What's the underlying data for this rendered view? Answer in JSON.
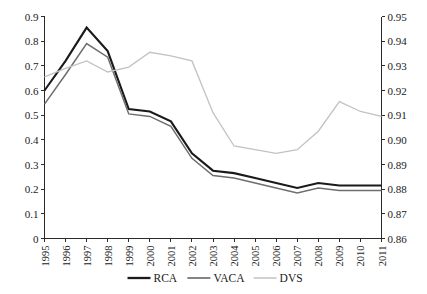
{
  "chart_data": {
    "type": "line",
    "title": "",
    "subtitle": "",
    "xlabel": "",
    "ylabel": "",
    "grid": false,
    "legend_position": "bottom",
    "categories": [
      "1995",
      "1996",
      "1997",
      "1998",
      "1999",
      "2000",
      "2001",
      "2002",
      "2003",
      "2004",
      "2005",
      "2006",
      "2007",
      "2008",
      "2009",
      "2010",
      "2011"
    ],
    "axes": {
      "left": {
        "min": 0,
        "max": 0.9,
        "step": 0.1,
        "ticks": [
          "0",
          "0.1",
          "0.2",
          "0.3",
          "0.4",
          "0.5",
          "0.6",
          "0.7",
          "0.8",
          "0.9"
        ],
        "series": [
          "RCA",
          "VACA"
        ]
      },
      "right": {
        "min": 0.86,
        "max": 0.95,
        "step": 0.01,
        "ticks": [
          "0.86",
          "0.87",
          "0.88",
          "0.89",
          "0.90",
          "0.91",
          "0.92",
          "0.93",
          "0.94",
          "0.95"
        ],
        "series": [
          "DVS"
        ]
      }
    },
    "series": [
      {
        "name": "RCA",
        "axis": "left",
        "color": "#1a1a1a",
        "width": 2.1,
        "values": [
          0.6,
          0.72,
          0.855,
          0.76,
          0.525,
          0.515,
          0.475,
          0.345,
          0.275,
          0.265,
          0.245,
          0.225,
          0.205,
          0.225,
          0.215,
          0.215,
          0.215
        ]
      },
      {
        "name": "VACA",
        "axis": "left",
        "color": "#6e6e6e",
        "width": 1.5,
        "values": [
          0.545,
          0.665,
          0.79,
          0.735,
          0.505,
          0.495,
          0.455,
          0.325,
          0.255,
          0.245,
          0.225,
          0.205,
          0.185,
          0.205,
          0.195,
          0.195,
          0.195
        ]
      },
      {
        "name": "DVS",
        "axis": "right",
        "color": "#c2c2c2",
        "width": 1.3,
        "values": [
          0.9255,
          0.929,
          0.932,
          0.9275,
          0.9295,
          0.9355,
          0.934,
          0.932,
          0.911,
          0.8975,
          0.896,
          0.8945,
          0.896,
          0.9035,
          0.9155,
          0.9115,
          0.9095
        ]
      }
    ],
    "legend": [
      {
        "label": "RCA",
        "color": "#1a1a1a",
        "width": 2.3
      },
      {
        "label": "VACA",
        "color": "#6e6e6e",
        "width": 1.7
      },
      {
        "label": "DVS",
        "color": "#c2c2c2",
        "width": 1.5
      }
    ]
  }
}
